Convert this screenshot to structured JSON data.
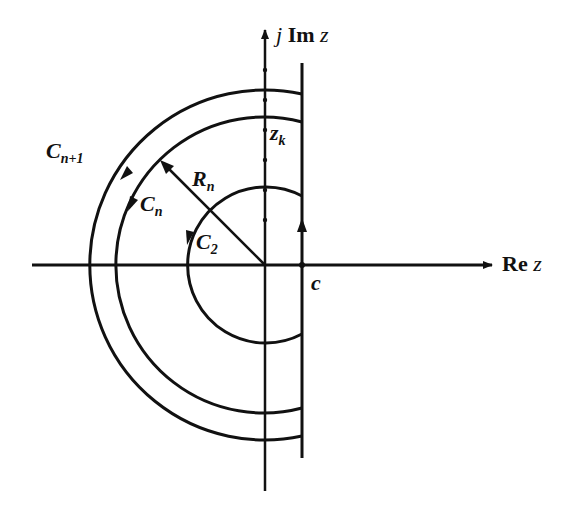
{
  "diagram": {
    "type": "complex-plane contour diagram",
    "axes": {
      "imaginary_label_j": "j",
      "imaginary_label_im": "Im",
      "imaginary_label_z": "z",
      "real_label_re": "Re",
      "real_label_z": "z"
    },
    "labels": {
      "c_n1_main": "C",
      "c_n1_sub": "n+1",
      "c_n_main": "C",
      "c_n_sub": "n",
      "r_n_main": "R",
      "r_n_sub": "n",
      "c_2_main": "C",
      "c_2_sub": "2",
      "z_k_main": "z",
      "z_k_sub": "k",
      "c_point": "c"
    },
    "geometry": {
      "origin": [
        265,
        265
      ],
      "vertical_line_c_x": 302,
      "contours": [
        {
          "name": "C_{n+1}",
          "radius": 175
        },
        {
          "name": "C_n",
          "radius": 148
        },
        {
          "name": "C_2",
          "radius": 78
        }
      ]
    },
    "colors": {
      "ink": "#111111",
      "background": "#ffffff"
    }
  }
}
